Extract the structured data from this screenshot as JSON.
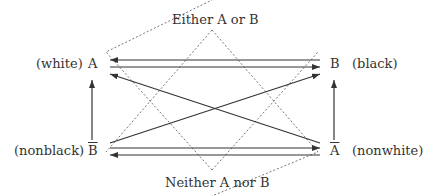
{
  "title_top": "Either A or B",
  "title_bottom": "Neither A nor B",
  "nodes": {
    "A": {
      "symbol": "A",
      "label": "(white)"
    },
    "B": {
      "symbol": "B",
      "label": "(black)"
    },
    "notB": {
      "symbol": "B",
      "label": "(nonblack)",
      "overline": true
    },
    "notA": {
      "symbol": "A",
      "label": "(nonwhite)",
      "overline": true
    }
  },
  "edges": [
    {
      "from": "B",
      "to": "A",
      "style": "solid"
    },
    {
      "from": "A",
      "to": "B",
      "style": "solid"
    },
    {
      "from": "notB",
      "to": "A",
      "style": "solid"
    },
    {
      "from": "notA",
      "to": "B",
      "style": "solid"
    },
    {
      "from": "notA",
      "to": "A",
      "style": "solid"
    },
    {
      "from": "notB",
      "to": "B",
      "style": "solid"
    },
    {
      "from": "notB",
      "to": "notA",
      "style": "solid"
    },
    {
      "from": "notA",
      "to": "notB",
      "style": "solid"
    }
  ],
  "regions": [
    {
      "name": "either-a-or-b",
      "style": "dotted"
    },
    {
      "name": "neither-a-nor-b",
      "style": "dotted"
    }
  ],
  "colors": {
    "line": "#333333",
    "dotted": "#777777"
  }
}
